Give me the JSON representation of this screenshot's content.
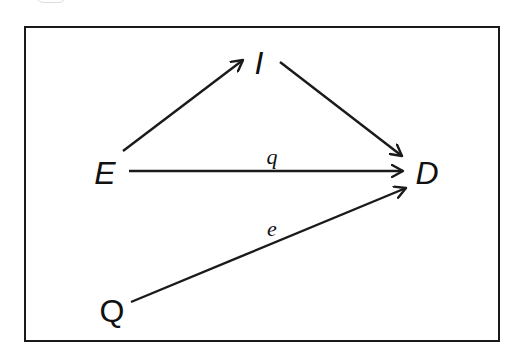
{
  "diagram": {
    "type": "directed-graph",
    "frame": {
      "border_color": "#1a1a1a"
    },
    "nodes": [
      {
        "id": "I",
        "label": "I",
        "italic": true,
        "x": 259,
        "y": 63
      },
      {
        "id": "E",
        "label": "E",
        "italic": true,
        "x": 105,
        "y": 172
      },
      {
        "id": "D",
        "label": "D",
        "italic": true,
        "x": 426,
        "y": 172
      },
      {
        "id": "Q",
        "label": "Q",
        "italic": false,
        "x": 112,
        "y": 310
      }
    ],
    "edges": [
      {
        "from": "E",
        "to": "I",
        "label": ""
      },
      {
        "from": "I",
        "to": "D",
        "label": ""
      },
      {
        "from": "E",
        "to": "D",
        "label": "q"
      },
      {
        "from": "Q",
        "to": "D",
        "label": "e"
      }
    ],
    "edge_labels": {
      "q": "q",
      "e": "e"
    },
    "line_color": "#1a1a1a"
  }
}
